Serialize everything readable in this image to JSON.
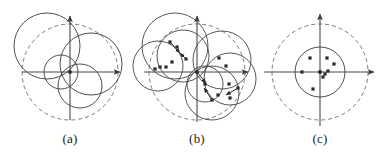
{
  "figure": {
    "width": 388,
    "height": 155,
    "background": "#ffffff",
    "stroke_solid": "#3a3a3a",
    "stroke_dashed": "#6b6b6b",
    "axis_color": "#4a4a4a",
    "marker_color": "#2b2b2b"
  },
  "captions": {
    "a": "(a)",
    "b": "(b)",
    "c": "(c)"
  },
  "panels": [
    {
      "id": "a",
      "label": "(a)",
      "origin": {
        "x": 70,
        "y": 72
      },
      "axes": {
        "x": {
          "x1": 22,
          "y1": 72,
          "x2": 122,
          "y2": 72,
          "arrow": "right"
        },
        "y": {
          "x1": 70,
          "y1": 120,
          "x2": 70,
          "y2": 14,
          "arrow": "up"
        }
      },
      "dashed_circles": [
        {
          "cx": 70,
          "cy": 72,
          "r": 48
        }
      ],
      "solid_circles": [
        {
          "cx": 47,
          "cy": 46,
          "r": 33
        },
        {
          "cx": 91,
          "cy": 64,
          "r": 31
        },
        {
          "cx": 80,
          "cy": 86,
          "r": 22
        },
        {
          "cx": 61,
          "cy": 72,
          "r": 17
        }
      ],
      "markers": []
    },
    {
      "id": "b",
      "label": "(b)",
      "origin": {
        "x": 197,
        "y": 72
      },
      "axes": {
        "x": {
          "x1": 144,
          "y1": 72,
          "x2": 250,
          "y2": 72,
          "arrow": "right"
        },
        "y": {
          "x1": 197,
          "y1": 122,
          "x2": 197,
          "y2": 14,
          "arrow": "up"
        }
      },
      "dashed_circles": [
        {
          "cx": 197,
          "cy": 72,
          "r": 48
        }
      ],
      "solid_circles": [
        {
          "cx": 175,
          "cy": 46,
          "r": 33
        },
        {
          "cx": 158,
          "cy": 66,
          "r": 25
        },
        {
          "cx": 183,
          "cy": 56,
          "r": 26
        },
        {
          "cx": 222,
          "cy": 60,
          "r": 29
        },
        {
          "cx": 230,
          "cy": 79,
          "r": 26
        },
        {
          "cx": 212,
          "cy": 93,
          "r": 27
        },
        {
          "cx": 205,
          "cy": 84,
          "r": 18
        }
      ],
      "markers": [
        {
          "x": 170,
          "y": 42
        },
        {
          "x": 177,
          "y": 47
        },
        {
          "x": 172,
          "y": 62
        },
        {
          "x": 186,
          "y": 59
        },
        {
          "x": 160,
          "y": 67
        },
        {
          "x": 166,
          "y": 67
        },
        {
          "x": 155,
          "y": 69
        },
        {
          "x": 219,
          "y": 58
        },
        {
          "x": 226,
          "y": 66
        },
        {
          "x": 205,
          "y": 84
        },
        {
          "x": 229,
          "y": 84
        },
        {
          "x": 238,
          "y": 88
        },
        {
          "x": 218,
          "y": 95
        },
        {
          "x": 212,
          "y": 100
        },
        {
          "x": 230,
          "y": 98
        }
      ],
      "vectors": [
        {
          "x1": 170,
          "y1": 42,
          "x2": 180,
          "y2": 53
        },
        {
          "x1": 186,
          "y1": 59,
          "x2": 180,
          "y2": 53
        },
        {
          "x1": 238,
          "y1": 88,
          "x2": 226,
          "y2": 95
        },
        {
          "x1": 212,
          "y1": 100,
          "x2": 204,
          "y2": 88
        },
        {
          "x1": 197,
          "y1": 72,
          "x2": 206,
          "y2": 83
        }
      ]
    },
    {
      "id": "c",
      "label": "(c)",
      "origin": {
        "x": 320,
        "y": 72
      },
      "axes": {
        "x": {
          "x1": 264,
          "y1": 72,
          "x2": 376,
          "y2": 72,
          "arrow": "right"
        },
        "y": {
          "x1": 320,
          "y1": 126,
          "x2": 320,
          "y2": 12,
          "arrow": "up"
        }
      },
      "dashed_circles": [
        {
          "cx": 320,
          "cy": 72,
          "r": 48
        }
      ],
      "solid_circles": [
        {
          "cx": 320,
          "cy": 72,
          "r": 25
        }
      ],
      "markers": [
        {
          "x": 310,
          "y": 58
        },
        {
          "x": 327,
          "y": 58
        },
        {
          "x": 334,
          "y": 64
        },
        {
          "x": 302,
          "y": 72
        },
        {
          "x": 328,
          "y": 71
        },
        {
          "x": 325,
          "y": 74
        },
        {
          "x": 323,
          "y": 77
        },
        {
          "x": 313,
          "y": 89
        }
      ],
      "vectors": []
    }
  ]
}
